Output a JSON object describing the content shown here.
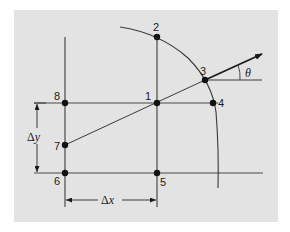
{
  "diagram": {
    "type": "finite-difference grid with circular arc and direction vector",
    "background_color": "#e3e3e3",
    "line_color": "#3a3a3a",
    "points": [
      {
        "id": "1",
        "label": "1",
        "x": 157,
        "y": 103
      },
      {
        "id": "2",
        "label": "2",
        "x": 157,
        "y": 37
      },
      {
        "id": "3",
        "label": "3",
        "x": 205,
        "y": 80
      },
      {
        "id": "4",
        "label": "4",
        "x": 213,
        "y": 103
      },
      {
        "id": "5",
        "label": "5",
        "x": 157,
        "y": 173
      },
      {
        "id": "6",
        "label": "6",
        "x": 65,
        "y": 173
      },
      {
        "id": "7",
        "label": "7",
        "x": 65,
        "y": 145
      },
      {
        "id": "8",
        "label": "8",
        "x": 65,
        "y": 103
      }
    ],
    "dimensions": {
      "dx": {
        "symbol": "Δ",
        "var": "x"
      },
      "dy": {
        "symbol": "Δ",
        "var": "y"
      }
    },
    "angle": {
      "label": "θ"
    }
  }
}
